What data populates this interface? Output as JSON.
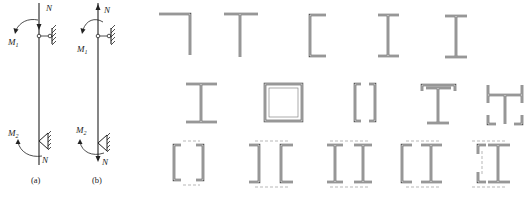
{
  "figure": {
    "columns": [
      {
        "id": "a",
        "caption": "(a)",
        "labels": {
          "top_force": "N",
          "bottom_force": "N",
          "top_moment": "M",
          "top_moment_sub": "1",
          "bottom_moment": "M",
          "bottom_moment_sub": "2"
        },
        "description": "Column with axial compressive force N and end moments M1, M2; pinned top, hinged support at bottom"
      },
      {
        "id": "b",
        "caption": "(b)",
        "labels": {
          "top_force": "N",
          "bottom_force": "N",
          "top_moment": "M",
          "top_moment_sub": "1",
          "bottom_moment": "M",
          "bottom_moment_sub": "2"
        },
        "description": "Column with axial tensile force N and end moments M1, M2"
      }
    ],
    "cross_sections": {
      "row1": [
        "angle",
        "tee",
        "channel",
        "i-beam",
        "i-beam-tapered"
      ],
      "row2": [
        "welded-i",
        "box",
        "double-channel-facing",
        "i-with-channel-cap",
        "h-built-up"
      ],
      "row3": [
        "double-channel-lattice",
        "double-channel-back-to-back",
        "double-i-lattice",
        "channel-and-i-lattice",
        "angle-and-i-lattice"
      ]
    }
  }
}
